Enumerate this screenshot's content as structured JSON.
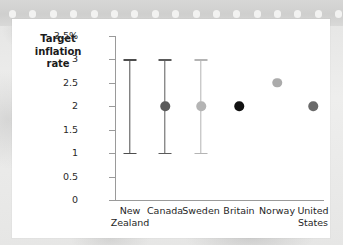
{
  "decor": {
    "perforation_count": 24,
    "strip_color": "#d4d4d3",
    "hole_color": "#f2f2f1",
    "card_color": "#ffffff",
    "page_background": "#e9e9e8"
  },
  "chart_data": {
    "type": "scatter",
    "title": "",
    "subtitle": "",
    "xlabel": "",
    "ylabel": "Target inflation rate",
    "ylim": [
      0,
      3.5
    ],
    "yticks": [
      0,
      0.5,
      1,
      1.5,
      2,
      2.5,
      3,
      3.5
    ],
    "ytick_labels": [
      "0",
      "0.5",
      "1",
      "1.5",
      "2",
      "2.5",
      "3",
      "3.5%"
    ],
    "grid": false,
    "legend": false,
    "legend_position": "none",
    "axis_color": "#9a9a9a",
    "errorbar_color": "#4d4d4d",
    "categories": [
      "New Zealand",
      "Canada",
      "Sweden",
      "Britain",
      "Norway",
      "United States"
    ],
    "category_labels": [
      "New\nZealand",
      "Canada",
      "Sweden",
      "Britain",
      "Norway",
      "United\nStates"
    ],
    "points": [
      {
        "category": "New Zealand",
        "value": null,
        "low": 1.0,
        "high": 3.0,
        "color": "#4d4d4d",
        "has_dot": false,
        "has_range": true
      },
      {
        "category": "Canada",
        "value": 2.0,
        "low": 1.0,
        "high": 3.0,
        "color": "#5a5a5a",
        "has_dot": true,
        "has_range": true
      },
      {
        "category": "Sweden",
        "value": 2.0,
        "low": 1.0,
        "high": 3.0,
        "color": "#b4b4b4",
        "has_dot": true,
        "has_range": true
      },
      {
        "category": "Britain",
        "value": 2.0,
        "low": null,
        "high": null,
        "color": "#111111",
        "has_dot": true,
        "has_range": false
      },
      {
        "category": "Norway",
        "value": 2.5,
        "low": null,
        "high": null,
        "color": "#ababab",
        "has_dot": true,
        "has_range": false
      },
      {
        "category": "United States",
        "value": 2.0,
        "low": null,
        "high": null,
        "color": "#6a6a6a",
        "has_dot": true,
        "has_range": false
      }
    ]
  }
}
